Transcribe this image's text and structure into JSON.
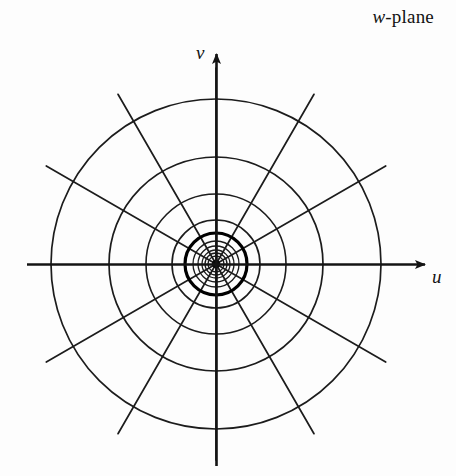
{
  "figure": {
    "name": "w-plane-polar-grid",
    "plane_label": "w-plane",
    "plane_label_variable": "w",
    "plane_label_suffix": "-plane",
    "axes": {
      "horizontal_label": "u",
      "vertical_label": "v",
      "horizontal_label_name": "u-axis-label",
      "vertical_label_name": "v-axis-label"
    },
    "colors": {
      "ink": "#141414",
      "paper": "#fdfdfd",
      "grid": "#1c1c1c",
      "emphasis": "#000000"
    }
  },
  "chart_data": {
    "type": "line",
    "title": "w-plane",
    "subtitle": "",
    "xlabel": "u",
    "ylabel": "v",
    "grid": true,
    "legend_position": "none",
    "coordinate_system": "polar",
    "center_px": [
      216,
      264
    ],
    "axis_extent_px": {
      "x_min": 27,
      "x_max": 434,
      "y_min": 45,
      "y_max": 466
    },
    "circle_radii_px": [
      8,
      11,
      14,
      18,
      23,
      31,
      44,
      70,
      107,
      165
    ],
    "emphasized_circle_radius_px": 31,
    "spoke_count": 12,
    "spoke_angles_deg": [
      0,
      30,
      60,
      90,
      120,
      150,
      180,
      210,
      240,
      270,
      300,
      330
    ],
    "spoke_outer_radius_px": 196,
    "annotations": [
      {
        "text": "w-plane",
        "x": 360,
        "y": 18
      },
      {
        "text": "v",
        "x": 203,
        "y": 52
      },
      {
        "text": "u",
        "x": 438,
        "y": 276
      }
    ]
  }
}
